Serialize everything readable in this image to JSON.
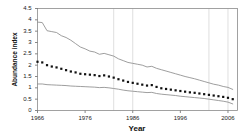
{
  "chart_data": {
    "type": "line",
    "title": "",
    "xlabel": "Year",
    "ylabel": "Abundance index",
    "xlim": [
      1966,
      2008
    ],
    "ylim": [
      0,
      4.5
    ],
    "xticks": [
      1966,
      1976,
      1986,
      1996,
      2006
    ],
    "yticks": [
      0,
      0.5,
      1,
      1.5,
      2,
      2.5,
      3,
      3.5,
      4,
      4.5
    ],
    "ytick_labels": [
      "0",
      "0.5",
      "1",
      "1.5",
      "2",
      "2.5",
      "3",
      "3.5",
      "4",
      "4.5"
    ],
    "xtick_labels": [
      "1966",
      "1976",
      "1986",
      "1996",
      "2006"
    ],
    "grid": "vertical-only",
    "legend": "none",
    "x": [
      1966,
      1967,
      1968,
      1969,
      1970,
      1971,
      1972,
      1973,
      1974,
      1975,
      1976,
      1977,
      1978,
      1979,
      1980,
      1981,
      1982,
      1983,
      1984,
      1985,
      1986,
      1987,
      1988,
      1989,
      1990,
      1991,
      1992,
      1993,
      1994,
      1995,
      1996,
      1997,
      1998,
      1999,
      2000,
      2001,
      2002,
      2003,
      2004,
      2005,
      2006,
      2007
    ],
    "series": [
      {
        "name": "Upper confidence limit",
        "style": "solid-line",
        "color": "#8c8c8c",
        "values": [
          3.9,
          3.88,
          3.52,
          3.48,
          3.44,
          3.3,
          3.22,
          3.1,
          2.95,
          2.8,
          2.72,
          2.62,
          2.58,
          2.48,
          2.52,
          2.46,
          2.4,
          2.28,
          2.2,
          2.12,
          2.08,
          2.04,
          2.0,
          1.92,
          1.95,
          1.86,
          1.8,
          1.74,
          1.68,
          1.62,
          1.56,
          1.5,
          1.45,
          1.4,
          1.34,
          1.28,
          1.22,
          1.16,
          1.12,
          1.06,
          1.02,
          0.93
        ]
      },
      {
        "name": "Abundance index (estimate)",
        "style": "dotted-markers",
        "color": "#111111",
        "values": [
          2.15,
          2.12,
          2.0,
          1.94,
          1.9,
          1.84,
          1.78,
          1.72,
          1.68,
          1.62,
          1.6,
          1.58,
          1.56,
          1.52,
          1.55,
          1.5,
          1.45,
          1.38,
          1.32,
          1.26,
          1.22,
          1.18,
          1.14,
          1.1,
          1.12,
          1.04,
          0.98,
          0.95,
          0.92,
          0.89,
          0.86,
          0.83,
          0.8,
          0.78,
          0.75,
          0.72,
          0.69,
          0.66,
          0.63,
          0.6,
          0.56,
          0.5
        ]
      },
      {
        "name": "Lower confidence limit",
        "style": "solid-line",
        "color": "#8c8c8c",
        "values": [
          1.17,
          1.17,
          1.14,
          1.13,
          1.12,
          1.11,
          1.1,
          1.08,
          1.07,
          1.06,
          1.05,
          1.04,
          1.03,
          1.01,
          1.02,
          1.0,
          0.97,
          0.94,
          0.9,
          0.87,
          0.85,
          0.83,
          0.81,
          0.79,
          0.8,
          0.75,
          0.72,
          0.7,
          0.68,
          0.66,
          0.63,
          0.61,
          0.59,
          0.57,
          0.55,
          0.53,
          0.5,
          0.47,
          0.44,
          0.41,
          0.37,
          0.29
        ]
      }
    ],
    "gridline_years": [
      1982,
      1986,
      2002,
      2006
    ]
  }
}
